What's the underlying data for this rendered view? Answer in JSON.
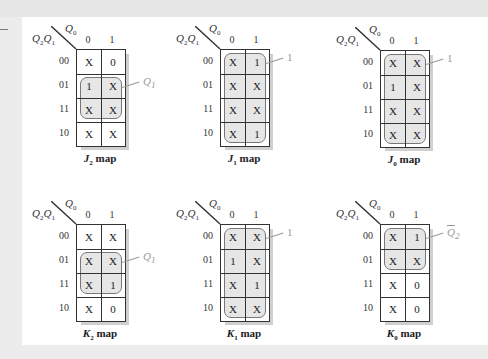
{
  "figure": {
    "col_var": "Q",
    "col_var_sub": "0",
    "row_var_1": "Q",
    "row_var_1_sub": "2",
    "row_var_2": "Q",
    "row_var_2_sub": "1",
    "col_headers": [
      "0",
      "1"
    ],
    "row_headers": [
      "00",
      "01",
      "11",
      "10"
    ],
    "map_suffix": "map"
  },
  "maps": [
    {
      "name": "J",
      "sub": "2",
      "cells": [
        [
          "X",
          "0"
        ],
        [
          "1",
          "X"
        ],
        [
          "X",
          "X"
        ],
        [
          "X",
          "X"
        ]
      ],
      "group": {
        "rows": [
          1,
          2
        ],
        "cols": [
          0,
          1
        ]
      },
      "group_label": "Q",
      "group_label_sub": "1",
      "group_label_bar": false
    },
    {
      "name": "J",
      "sub": "1",
      "cells": [
        [
          "X",
          "1"
        ],
        [
          "X",
          "X"
        ],
        [
          "X",
          "X"
        ],
        [
          "X",
          "1"
        ]
      ],
      "group": {
        "rows": [
          0,
          3
        ],
        "cols": [
          0,
          1
        ]
      },
      "group_label": "1",
      "group_label_sub": "",
      "group_label_bar": false
    },
    {
      "name": "J",
      "sub": "0",
      "cells": [
        [
          "X",
          "X"
        ],
        [
          "1",
          "X"
        ],
        [
          "X",
          "X"
        ],
        [
          "X",
          "X"
        ]
      ],
      "group": {
        "rows": [
          0,
          3
        ],
        "cols": [
          0,
          1
        ]
      },
      "group_label": "1",
      "group_label_sub": "",
      "group_label_bar": false
    },
    {
      "name": "K",
      "sub": "2",
      "cells": [
        [
          "X",
          "X"
        ],
        [
          "X",
          "X"
        ],
        [
          "X",
          "1"
        ],
        [
          "X",
          "0"
        ]
      ],
      "group": {
        "rows": [
          1,
          2
        ],
        "cols": [
          0,
          1
        ]
      },
      "group_label": "Q",
      "group_label_sub": "1",
      "group_label_bar": false
    },
    {
      "name": "K",
      "sub": "1",
      "cells": [
        [
          "X",
          "X"
        ],
        [
          "1",
          "X"
        ],
        [
          "X",
          "1"
        ],
        [
          "X",
          "X"
        ]
      ],
      "group": {
        "rows": [
          0,
          3
        ],
        "cols": [
          0,
          1
        ]
      },
      "group_label": "1",
      "group_label_sub": "",
      "group_label_bar": false
    },
    {
      "name": "K",
      "sub": "0",
      "cells": [
        [
          "X",
          "1"
        ],
        [
          "X",
          "X"
        ],
        [
          "X",
          "0"
        ],
        [
          "X",
          "0"
        ]
      ],
      "group": {
        "rows": [
          0,
          1
        ],
        "cols": [
          0,
          1
        ]
      },
      "group_label": "Q",
      "group_label_sub": "2",
      "group_label_bar": true
    }
  ]
}
